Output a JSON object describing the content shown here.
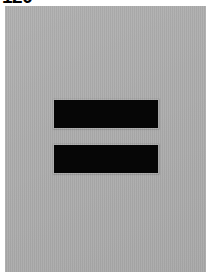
{
  "page": {
    "background_color": "#ffffff",
    "width": 214,
    "height": 274
  },
  "caption": {
    "text": "120",
    "note": "bold numeric label at top-left, vertically clipped by the page crop",
    "color": "#000000"
  },
  "panel": {
    "name": "gray-image-panel",
    "background_color": "#acacac",
    "left": 5,
    "top": 6,
    "width": 201,
    "height": 266
  },
  "glyph": {
    "symbol": "=",
    "description": "equals sign rendered as two solid black horizontal bars",
    "color": "#060606",
    "bars": [
      {
        "label": "upper-bar",
        "left": 49,
        "top": 94,
        "width": 104,
        "height": 28
      },
      {
        "label": "lower-bar",
        "left": 49,
        "top": 139,
        "width": 104,
        "height": 28
      }
    ],
    "gap_height": 17
  }
}
